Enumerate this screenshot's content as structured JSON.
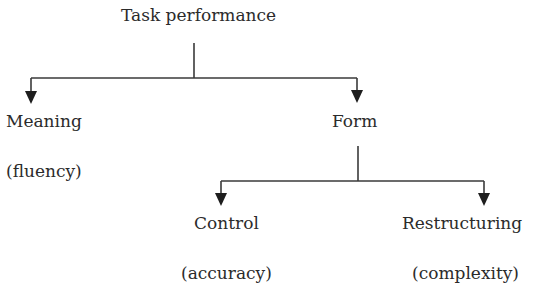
{
  "diagram": {
    "root": {
      "label": "Task performance"
    },
    "level1": [
      {
        "label": "Meaning",
        "sublabel": "(fluency)"
      },
      {
        "label": "Form",
        "sublabel": ""
      }
    ],
    "level2": [
      {
        "label": "Control",
        "sublabel": "(accuracy)"
      },
      {
        "label": "Restructuring",
        "sublabel": "(complexity)"
      }
    ],
    "colors": {
      "line": "#3a3a3a",
      "text": "#2b2b2b",
      "background": "#ffffff"
    }
  }
}
